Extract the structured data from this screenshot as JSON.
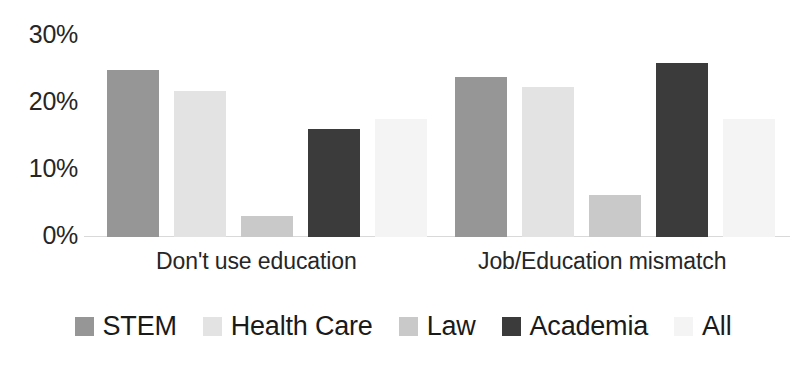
{
  "chart_data": {
    "type": "bar",
    "title": "",
    "subtitle": "",
    "xlabel": "",
    "ylabel": "",
    "categories": [
      "Don't use education",
      "Job/Education mismatch"
    ],
    "series": [
      {
        "name": "STEM",
        "color": "#969696",
        "values": [
          24,
          23
        ]
      },
      {
        "name": "Health Care",
        "color": "#e3e3e3",
        "values": [
          21,
          21.5
        ]
      },
      {
        "name": "Law",
        "color": "#c9c9c9",
        "values": [
          3,
          6
        ]
      },
      {
        "name": "Academia",
        "color": "#3b3b3b",
        "values": [
          15.5,
          25
        ]
      },
      {
        "name": "All",
        "color": "#f4f4f4",
        "values": [
          17,
          17
        ]
      }
    ],
    "ylim": [
      0,
      30
    ],
    "y_ticks": [
      0,
      10,
      20,
      30
    ],
    "y_tick_labels": [
      "0%",
      "10%",
      "20%",
      "30%"
    ],
    "grid": false,
    "legend_position": "bottom",
    "value_format": "percent"
  },
  "axis": {
    "y_labels": [
      "30%",
      "20%",
      "10%",
      "0%"
    ]
  },
  "legend": {
    "items": [
      {
        "label": "STEM"
      },
      {
        "label": "Health Care"
      },
      {
        "label": "Law"
      },
      {
        "label": "Academia"
      },
      {
        "label": "All"
      }
    ]
  }
}
